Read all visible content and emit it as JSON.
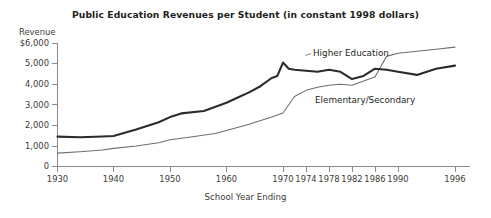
{
  "chart_data": {
    "type": "line",
    "title": "Public Education Revenues per Student (in constant 1998 dollars)",
    "xlabel": "School Year Ending",
    "ylabel": "Revenue",
    "grid": false,
    "legend_position": "inline-annotation",
    "ylim": [
      0,
      6000
    ],
    "yticks": [
      0,
      1000,
      2000,
      3000,
      4000,
      5000,
      6000
    ],
    "ytick_labels": [
      "0",
      "1,000",
      "2,000",
      "3,000",
      "4,000",
      "5,000",
      "$6,000"
    ],
    "xlim": [
      1930,
      1996
    ],
    "xticks": [
      1930,
      1940,
      1950,
      1960,
      1970,
      1974,
      1978,
      1982,
      1986,
      1990,
      1996
    ],
    "xtick_labels": [
      "1930",
      "1940",
      "1950",
      "1960",
      "1970",
      "1974",
      "1978",
      "1982",
      "1986",
      "1990",
      "1996"
    ],
    "x_axis_note": "Axis is compressed after 1970: decades 1930-1970 share equal spacing, then 4-year steps 1970-1990, then 1990-1996.",
    "series": [
      {
        "name": "Higher Education",
        "color": "#2b2b2b",
        "line_width": "thick",
        "x": [
          1930,
          1934,
          1938,
          1940,
          1944,
          1948,
          1950,
          1952,
          1956,
          1960,
          1962,
          1964,
          1966,
          1968,
          1969,
          1970,
          1971,
          1972,
          1974,
          1976,
          1978,
          1980,
          1982,
          1984,
          1986,
          1988,
          1990,
          1992,
          1994,
          1996
        ],
        "values": [
          1450,
          1420,
          1460,
          1480,
          1800,
          2150,
          2400,
          2580,
          2700,
          3100,
          3350,
          3600,
          3900,
          4300,
          4400,
          5050,
          4750,
          4700,
          4650,
          4600,
          4700,
          4600,
          4250,
          4400,
          4750,
          4700,
          4600,
          4450,
          4750,
          4900
        ]
      },
      {
        "name": "Elementary/Secondary",
        "color": "#6e6e6e",
        "line_width": "thin",
        "x": [
          1930,
          1934,
          1938,
          1940,
          1944,
          1948,
          1950,
          1954,
          1958,
          1960,
          1964,
          1968,
          1970,
          1972,
          1974,
          1976,
          1978,
          1980,
          1982,
          1984,
          1986,
          1988,
          1990,
          1992,
          1994,
          1996
        ],
        "values": [
          650,
          720,
          800,
          880,
          1000,
          1150,
          1300,
          1450,
          1600,
          1750,
          2050,
          2400,
          2600,
          3400,
          3700,
          3850,
          3950,
          4000,
          3950,
          4150,
          4350,
          5350,
          5500,
          5600,
          5700,
          5800
        ]
      }
    ],
    "annotations": [
      {
        "text": "Higher Education",
        "x": 1974,
        "y": 5250
      },
      {
        "text": "Elementary/Secondary",
        "x": 1977,
        "y": 3100
      }
    ]
  }
}
